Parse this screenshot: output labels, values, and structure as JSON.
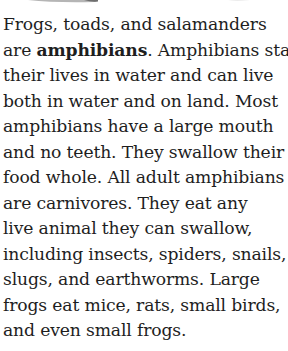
{
  "passage": {
    "lines": [
      {
        "before": "Frogs, toads, and salamanders",
        "bold": "",
        "after": ""
      },
      {
        "before": "are ",
        "bold": "amphibians",
        "after": ". Amphibians start"
      },
      {
        "before": "their lives in water and can live",
        "bold": "",
        "after": ""
      },
      {
        "before": "both in water and on land. Most",
        "bold": "",
        "after": ""
      },
      {
        "before": "amphibians have a large mouth",
        "bold": "",
        "after": ""
      },
      {
        "before": "and no teeth. They swallow their",
        "bold": "",
        "after": ""
      },
      {
        "before": "food whole. All adult amphibians",
        "bold": "",
        "after": ""
      },
      {
        "before": "are carnivores. They eat any",
        "bold": "",
        "after": ""
      },
      {
        "before": "live animal they can swallow,",
        "bold": "",
        "after": ""
      },
      {
        "before": "including insects, spiders, snails,",
        "bold": "",
        "after": ""
      },
      {
        "before": "slugs, and earthworms. Large",
        "bold": "",
        "after": ""
      },
      {
        "before": "frogs eat mice, rats, small birds,",
        "bold": "",
        "after": ""
      },
      {
        "before": "and even small frogs.",
        "bold": "",
        "after": ""
      }
    ],
    "keyword": "amphibians"
  },
  "colors": {
    "text": "#1e1e1e",
    "background": "#ffffff",
    "illustration_edge": "#9a9a9a"
  }
}
